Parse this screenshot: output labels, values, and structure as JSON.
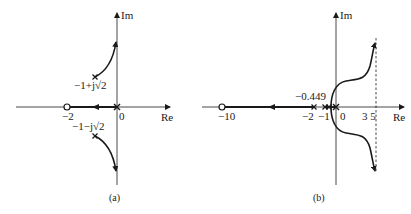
{
  "panels": [
    {
      "id": "a",
      "caption": "(a)",
      "axes": {
        "x_label": "Re",
        "y_label": "Im"
      },
      "labels": {
        "upper_pole": "−1+j√2",
        "lower_pole": "−1−j√2",
        "zero": "−2",
        "origin": "0"
      },
      "poles": [
        "0",
        "−1+j√2",
        "−1−j√2"
      ],
      "zeros": [
        "−2"
      ]
    },
    {
      "id": "b",
      "caption": "(b)",
      "axes": {
        "x_label": "Re",
        "y_label": "Im"
      },
      "labels": {
        "breakaway": "−0.449",
        "zero": "−10",
        "tick_m2": "−2",
        "tick_m1": "−1",
        "origin": "0",
        "asymptote": "3 5"
      },
      "poles": [
        "0",
        "−1",
        "−2"
      ],
      "zeros": [
        "−10"
      ]
    }
  ],
  "colors": {
    "ink": "#1a1a1a",
    "background": "#ffffff"
  }
}
